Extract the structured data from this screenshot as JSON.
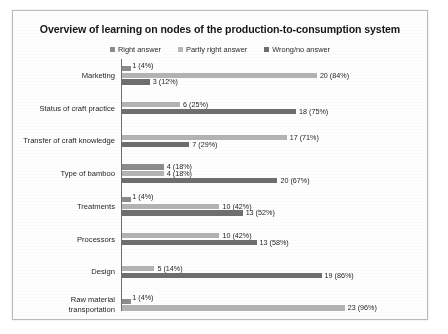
{
  "chart_data": {
    "type": "bar",
    "orientation": "horizontal",
    "title": "Overview of learning on nodes of the production-to-consumption system",
    "xlabel": "",
    "ylabel": "",
    "grid": false,
    "legend_position": "top-center",
    "xlim": [
      0,
      100
    ],
    "categories": [
      "Marketing",
      "Status of craft practice",
      "Transfer of craft knowledge",
      "Type of bamboo",
      "Treatments",
      "Processors",
      "Design",
      "Raw material transportation"
    ],
    "series": [
      {
        "name": "Right answer",
        "color": "#8c8c8c",
        "values": [
          4,
          null,
          null,
          18,
          4,
          null,
          null,
          4
        ],
        "counts": [
          1,
          null,
          null,
          4,
          1,
          null,
          null,
          1
        ],
        "labels": [
          "1 (4%)",
          null,
          null,
          "4 (18%)",
          "1 (4%)",
          null,
          null,
          "1 (4%)"
        ]
      },
      {
        "name": "Partly right answer",
        "color": "#b3b3b3",
        "values": [
          84,
          25,
          71,
          18,
          42,
          42,
          14,
          96
        ],
        "counts": [
          20,
          6,
          17,
          4,
          10,
          10,
          5,
          23
        ],
        "labels": [
          "20 (84%)",
          "6 (25%)",
          "17 (71%)",
          "4 (18%)",
          "10 (42%)",
          "10 (42%)",
          "5 (14%)",
          "23 (96%)"
        ]
      },
      {
        "name": "Wrong/no answer",
        "color": "#6e6e6e",
        "values": [
          12,
          75,
          29,
          67,
          52,
          58,
          86,
          null
        ],
        "counts": [
          3,
          18,
          7,
          20,
          13,
          13,
          19,
          null
        ],
        "labels": [
          "3 (12%)",
          "18 (75%)",
          "7 (29%)",
          "20 (67%)",
          "13 (52%)",
          "13 (58%)",
          "19 (86%)",
          null
        ]
      }
    ]
  },
  "legend": {
    "items": [
      {
        "label": "Right answer",
        "color": "#8c8c8c"
      },
      {
        "label": "Partly right answer",
        "color": "#b8b8b8"
      },
      {
        "label": "Wrong/no answer",
        "color": "#6e6e6e"
      }
    ]
  }
}
